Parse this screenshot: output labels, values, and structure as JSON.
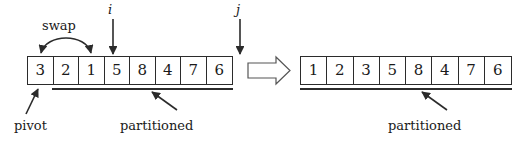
{
  "diagram": {
    "ink_color": "#2b2b2b",
    "background": "#ffffff"
  },
  "before": {
    "name": "left-array",
    "cells": [
      "3",
      "2",
      "1",
      "5",
      "8",
      "4",
      "7",
      "6"
    ],
    "annotations": {
      "swap": "swap",
      "i": "i",
      "j": "j",
      "pivot": "pivot",
      "partitioned": "partitioned"
    }
  },
  "transition": {
    "arrow_icon": "right-double-arrow-icon"
  },
  "after": {
    "name": "right-array",
    "cells": [
      "1",
      "2",
      "3",
      "5",
      "8",
      "4",
      "7",
      "6"
    ],
    "annotations": {
      "partitioned": "partitioned"
    }
  }
}
